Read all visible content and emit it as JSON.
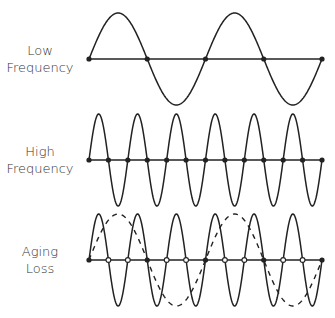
{
  "diagram": {
    "rows": [
      {
        "id": "low",
        "label_line1": "Low",
        "label_line2": "Frequency",
        "label_top": 42
      },
      {
        "id": "high",
        "label_line1": "High",
        "label_line2": "Frequency",
        "label_top": 143
      },
      {
        "id": "aging",
        "label_line1": "Aging",
        "label_line2": "Loss",
        "label_top": 243
      }
    ],
    "geometry": {
      "x_start": 89,
      "x_end": 322,
      "low": {
        "axis_y": 59,
        "amplitude": 46,
        "cycles": 2
      },
      "high": {
        "axis_y": 160,
        "amplitude": 46,
        "cycles": 6
      },
      "aging": {
        "axis_y": 260,
        "amplitude": 46,
        "solid_cycles": 6,
        "dashed_cycles": 2
      }
    },
    "colors": {
      "line": "#222222",
      "text": "#333333",
      "background": "#ffffff"
    }
  }
}
